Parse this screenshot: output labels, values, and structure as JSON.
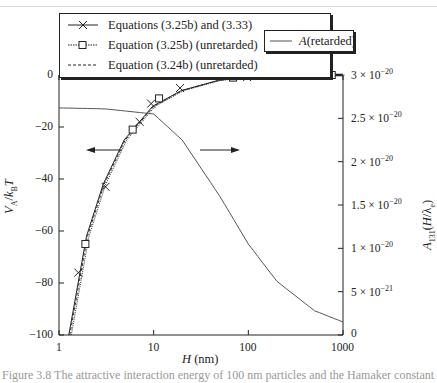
{
  "chart_data": {
    "type": "line",
    "title": "",
    "xlabel": "H (nm)",
    "ylabel_left": "V_A/k_B T",
    "ylabel_right": "A_131(H/λ_e)",
    "xscale": "log",
    "xlim": [
      1,
      1000
    ],
    "ylim_left": [
      -100,
      0
    ],
    "ylim_right": [
      0,
      3e-20
    ],
    "x_ticks": [
      "1",
      "10",
      "100",
      "1000"
    ],
    "y_left_ticks": [
      "0",
      "-20",
      "-40",
      "-60",
      "-80",
      "-100"
    ],
    "y_right_ticks": [
      "3 × 10^-20",
      "2.5 × 10^-20",
      "2 × 10^-20",
      "1.5 × 10^-20",
      "1 × 10^-20",
      "5 × 10^-21",
      "0"
    ],
    "grid": false,
    "legend_position": "top",
    "series": [
      {
        "name": "Equations (3.25b) and (3.33)",
        "axis": "left",
        "style": "solid-x-marker",
        "x": [
          1.6,
          3.1,
          7.1,
          9.4,
          19,
          97,
          520
        ],
        "y": [
          -76,
          -43,
          -18,
          -11,
          -5,
          -0.8,
          -0.2
        ]
      },
      {
        "name": "Equation (3.25b) (unretarded)",
        "axis": "left",
        "style": "dotted-square-marker",
        "x": [
          1.9,
          6.0,
          11.4,
          69,
          760
        ],
        "y": [
          -65,
          -21,
          -9,
          -1,
          0
        ]
      },
      {
        "name": "Equation (3.24b) (unretarded)",
        "axis": "left",
        "style": "dashed",
        "x": [
          1.3,
          2,
          3,
          5,
          10,
          20,
          50,
          100,
          1000
        ],
        "y": [
          -100,
          -62,
          -42,
          -25,
          -12,
          -6,
          -2,
          -1,
          0
        ]
      },
      {
        "name": "A (retarded)",
        "axis": "right",
        "style": "solid",
        "x": [
          1,
          3,
          10,
          20,
          50,
          100,
          200,
          500,
          1000
        ],
        "y": [
          2.62e-20,
          2.61e-20,
          2.55e-20,
          2.25e-20,
          1.6e-20,
          1.05e-20,
          6.2e-21,
          2.8e-21,
          1.5e-21
        ]
      }
    ],
    "annotations": [
      "left arrow → left axis (V_A curves)",
      "right arrow → right axis (A curve)"
    ]
  },
  "legend_main": {
    "items": [
      {
        "label": "Equations (3.25b) and (3.33)"
      },
      {
        "label": "Equation (3.25b) (unretarded)"
      },
      {
        "label": "Equation (3.24b) (unretarded)"
      }
    ]
  },
  "legend_right": {
    "items": [
      {
        "italic": "A",
        "label": " (retarded)"
      }
    ]
  },
  "axes": {
    "x_ticks": [
      "1",
      "10",
      "100",
      "1000"
    ],
    "y_left_ticks": [
      "0",
      "−20",
      "−40",
      "−60",
      "−80",
      "−100"
    ],
    "y_right_ticks": [
      {
        "mant": "3 × 10",
        "exp": "−20"
      },
      {
        "mant": "2.5 × 10",
        "exp": "−20"
      },
      {
        "mant": "2 × 10",
        "exp": "−20"
      },
      {
        "mant": "1.5 × 10",
        "exp": "−20"
      },
      {
        "mant": "1 × 10",
        "exp": "−20"
      },
      {
        "mant": "5 × 10",
        "exp": "−21"
      },
      {
        "mant": "0",
        "exp": ""
      }
    ],
    "xlabel_italic": "H",
    "xlabel_unit": " (nm)",
    "ylabel_left": "V_A / k_B T",
    "ylabel_right": "A_131(H/λ_e)"
  },
  "caption": "Figure 3.8    The attractive interaction energy of 100 nm particles and the Hamaker constant"
}
